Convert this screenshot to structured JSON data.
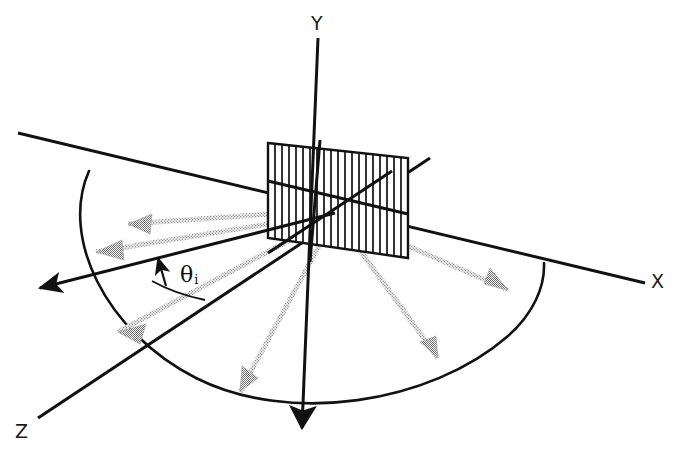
{
  "figure": {
    "type": "technical-line-diagram",
    "background_color": "#ffffff",
    "line_color": "#111111",
    "beam_color": "#8f8f8f"
  },
  "axes": {
    "x_label": "X",
    "y_label": "Y",
    "z_label": "Z",
    "origin": {
      "x": 335,
      "y": 213
    },
    "x_axis": {
      "from": {
        "x": 18,
        "y": 133
      },
      "to": {
        "x": 645,
        "y": 283
      }
    },
    "y_axis": {
      "from": {
        "x": 318,
        "y": 38
      },
      "to": {
        "x": 302,
        "y": 428
      }
    },
    "z_axis": {
      "from": {
        "x": 430,
        "y": 158
      },
      "to": {
        "x": 38,
        "y": 418
      }
    }
  },
  "grating": {
    "name": "plane-grating",
    "groove_count": 20,
    "corners": [
      {
        "x": 268,
        "y": 143
      },
      {
        "x": 408,
        "y": 158
      },
      {
        "x": 408,
        "y": 258
      },
      {
        "x": 268,
        "y": 238
      }
    ]
  },
  "angle": {
    "symbol": "θ",
    "subscript": "i",
    "name": "angle-of-incidence",
    "label_x": 180,
    "label_y": 262
  },
  "incident_beam": {
    "name": "incident-beam",
    "style": "solid-arrow",
    "arrow_tip": {
      "x": 38,
      "y": 290
    },
    "from_origin": true
  },
  "diffracted_orders": [
    {
      "name": "order-left-upper",
      "angle_deg": 196,
      "length": 252
    },
    {
      "name": "order-left-middle",
      "angle_deg": 186,
      "length": 258
    },
    {
      "name": "order-left-lower",
      "angle_deg": 168,
      "length": 248
    },
    {
      "name": "order-down-left",
      "angle_deg": 118,
      "length": 210
    },
    {
      "name": "order-down-right",
      "angle_deg": 62,
      "length": 205
    },
    {
      "name": "order-right",
      "angle_deg": 18,
      "length": 232
    }
  ],
  "arc": {
    "name": "diffraction-cone-arc",
    "description": "elliptical arc traced by diffracted orders",
    "center": {
      "x": 318,
      "y": 228
    },
    "radius_x": 238,
    "radius_y": 176,
    "rotation_deg": 13
  }
}
